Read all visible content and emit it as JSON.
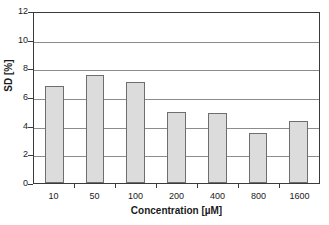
{
  "chart_data": {
    "type": "bar",
    "title": "",
    "xlabel": "Concentration [µM]",
    "ylabel": "SD [%]",
    "categories": [
      "10",
      "50",
      "100",
      "200",
      "400",
      "800",
      "1600"
    ],
    "values": [
      6.75,
      7.55,
      7.05,
      4.95,
      4.85,
      3.5,
      4.3
    ],
    "ylim": [
      0,
      12
    ],
    "yticks": [
      "0",
      "2",
      "4",
      "6",
      "8",
      "10",
      "12"
    ],
    "ytick_values": [
      0,
      2,
      4,
      6,
      8,
      10,
      12
    ],
    "grid": true,
    "grid_axis": "y",
    "legend": null,
    "series": [
      {
        "name": "SD",
        "values": [
          6.75,
          7.55,
          7.05,
          4.95,
          4.85,
          3.5,
          4.3
        ]
      }
    ],
    "colors": {
      "bar_fill": "#dcdcdc",
      "bar_border": "#6e6e6e",
      "gridline": "#8c8c8c",
      "axis": "#3a3a3a",
      "text": "#1a1a1a",
      "background": "#ffffff"
    }
  }
}
